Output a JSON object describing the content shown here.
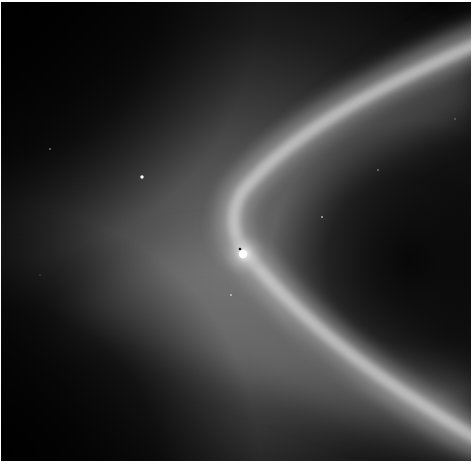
{
  "image": {
    "description": "Grayscale space photograph: a small bright moon embedded in a diffuse ring, with a bright curved arc of material sweeping around it and faint background stars",
    "background_color": "#050505",
    "border_color": "#ffffff",
    "frame": {
      "x": 1,
      "y": 2,
      "width": 470,
      "height": 459
    }
  },
  "features": {
    "moon": {
      "label": "moon",
      "x": 242,
      "y": 253,
      "radius": 4,
      "color": "#ffffff"
    },
    "stars": [
      {
        "x": 142,
        "y": 177,
        "r": 1.6
      },
      {
        "x": 50,
        "y": 149,
        "r": 0.8
      },
      {
        "x": 378,
        "y": 170,
        "r": 0.8
      },
      {
        "x": 322,
        "y": 217,
        "r": 0.9
      },
      {
        "x": 231,
        "y": 295,
        "r": 0.9
      },
      {
        "x": 455,
        "y": 119,
        "r": 0.7
      },
      {
        "x": 40,
        "y": 275,
        "r": 0.6
      }
    ],
    "arc": {
      "label": "bright curved ring arc",
      "color": "#d8d8d8",
      "path": "M 475 40 C 400 80, 300 120, 240 190 C 225 215, 232 245, 252 262 C 285 300, 330 340, 400 390 C 430 410, 455 430, 475 445"
    },
    "diffuse_ring": {
      "label": "broad diffuse glow",
      "color": "#9a9a9a"
    }
  }
}
